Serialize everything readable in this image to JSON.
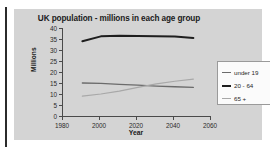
{
  "chart_data": {
    "type": "line",
    "title": "UK population - millions in each age group",
    "xlabel": "Year",
    "ylabel": "Millions",
    "xlim": [
      1980,
      2060
    ],
    "ylim": [
      0,
      40
    ],
    "xticks": [
      1980,
      2000,
      2020,
      2040,
      2060
    ],
    "yticks": [
      0,
      5,
      10,
      15,
      20,
      25,
      30,
      35,
      40
    ],
    "grid": false,
    "legend_position": "right",
    "x": [
      1991,
      2001,
      2011,
      2021,
      2031,
      2041,
      2051
    ],
    "series": [
      {
        "name": "under 19",
        "color": "#6b6b6b",
        "values": [
          15.0,
          14.8,
          14.4,
          14.0,
          13.6,
          13.3,
          13.0
        ]
      },
      {
        "name": "20 - 64",
        "color": "#1e1e1e",
        "values": [
          34.0,
          36.2,
          36.5,
          36.4,
          36.3,
          36.1,
          35.5
        ]
      },
      {
        "name": "65 +",
        "color": "#a8a8a8",
        "values": [
          9.0,
          10.0,
          11.3,
          13.0,
          14.6,
          15.8,
          16.8
        ]
      }
    ]
  },
  "legend": {
    "entries": [
      {
        "label": "under 19"
      },
      {
        "label": "20 - 64"
      },
      {
        "label": "65 +"
      }
    ]
  },
  "axes": {
    "y_tick_labels": [
      "40",
      "35",
      "30",
      "25",
      "20",
      "15",
      "10",
      "5",
      "0"
    ],
    "x_tick_labels": [
      "1980",
      "2000",
      "2020",
      "2040",
      "2060"
    ]
  },
  "colors": {
    "panel_background": "#d4d4d4",
    "page_background": "#ffffff",
    "axis": "#4a4a4a",
    "text": "#1a1a1a",
    "legend_background": "#fbfbfb",
    "legend_border": "#9a9a9a",
    "series_under19": "#6b6b6b",
    "series_20_64": "#1e1e1e",
    "series_65plus": "#a8a8a8"
  }
}
